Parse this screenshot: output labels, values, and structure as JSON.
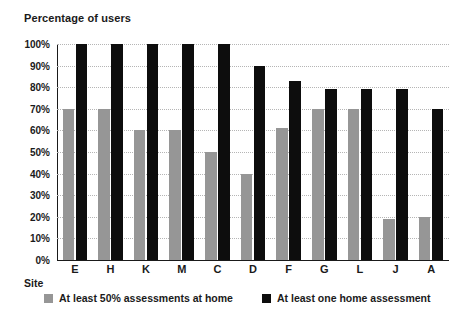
{
  "chart_data": {
    "type": "bar",
    "title": "Percentage of users",
    "xlabel": "Site",
    "ylabel": "Percentage of users",
    "ylim": [
      0,
      100
    ],
    "ytick_labels": [
      "0%",
      "10%",
      "20%",
      "30%",
      "40%",
      "50%",
      "60%",
      "70%",
      "80%",
      "90%",
      "100%"
    ],
    "ytick_values": [
      0,
      10,
      20,
      30,
      40,
      50,
      60,
      70,
      80,
      90,
      100
    ],
    "grid": true,
    "legend_position": "bottom",
    "categories": [
      "E",
      "H",
      "K",
      "M",
      "C",
      "D",
      "F",
      "G",
      "L",
      "J",
      "A"
    ],
    "series": [
      {
        "name": "At least 50% assessments at home",
        "color": "#969696",
        "values": [
          70,
          70,
          60,
          60,
          50,
          40,
          61,
          70,
          70,
          19,
          20
        ]
      },
      {
        "name": "At least one home assessment",
        "color": "#0d0d0d",
        "values": [
          100,
          100,
          100,
          100,
          100,
          90,
          83,
          79,
          79,
          79,
          70
        ]
      }
    ]
  },
  "colors": {
    "series_gray": "#969696",
    "series_black": "#0d0d0d",
    "axis": "#1a1a1a",
    "gridline": "#b5b5b5",
    "background": "#ffffff"
  }
}
